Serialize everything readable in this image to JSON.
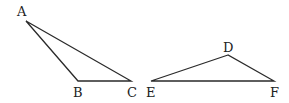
{
  "diagram": {
    "triangles": [
      {
        "name": "ABC",
        "vertices": [
          {
            "label": "A",
            "x": 26,
            "y": 21,
            "lx": 17,
            "ly": 16
          },
          {
            "label": "B",
            "x": 78,
            "y": 81,
            "lx": 73,
            "ly": 97
          },
          {
            "label": "C",
            "x": 131,
            "y": 81,
            "lx": 127,
            "ly": 97
          }
        ]
      },
      {
        "name": "DEF",
        "vertices": [
          {
            "label": "D",
            "x": 228,
            "y": 55,
            "lx": 223,
            "ly": 52
          },
          {
            "label": "E",
            "x": 151,
            "y": 81,
            "lx": 146,
            "ly": 97
          },
          {
            "label": "F",
            "x": 274,
            "y": 81,
            "lx": 270,
            "ly": 97
          }
        ]
      }
    ]
  }
}
